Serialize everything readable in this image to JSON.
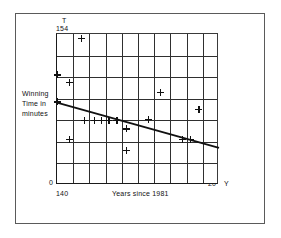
{
  "figure": {
    "frame": true,
    "background_color": "#ffffff",
    "ink_color": "#111111"
  },
  "axes": {
    "y_axis_symbol": "T",
    "y_axis_top_value": "154",
    "y_axis_origin_value": "0",
    "y_axis_title": "Winning Time in minutes",
    "x_axis_symbol": "Y",
    "x_axis_left_value": "140",
    "x_axis_right_value": "20",
    "x_axis_title": "Years since 1981"
  },
  "annotation": {
    "regression_equation": "T = 147.642-0.210Y"
  },
  "chart_data": {
    "type": "scatter",
    "title": "",
    "xlabel": "Years since 1981",
    "ylabel": "Winning Time in minutes",
    "xlim": [
      0,
      20
    ],
    "ylim": [
      140,
      154
    ],
    "grid": true,
    "grid_columns": 10,
    "grid_rows": 7,
    "x_ticks": [
      0,
      2,
      4,
      6,
      8,
      10,
      12,
      14,
      16,
      18,
      20
    ],
    "y_ticks": [
      140,
      142,
      144,
      146,
      148,
      150,
      152,
      154
    ],
    "legend": "none",
    "annotations": [
      {
        "text": "T = 147.642-0.210Y",
        "x": 7.2,
        "y": 149.4
      }
    ],
    "series": [
      {
        "name": "Winning time observations",
        "marker": "plus",
        "points": [
          {
            "x": 0.0,
            "y": 150.2
          },
          {
            "x": 1.5,
            "y": 149.5
          },
          {
            "x": 0.0,
            "y": 147.7
          },
          {
            "x": 3.4,
            "y": 146.0
          },
          {
            "x": 4.6,
            "y": 146.0
          },
          {
            "x": 5.5,
            "y": 146.0
          },
          {
            "x": 6.4,
            "y": 146.0
          },
          {
            "x": 7.4,
            "y": 146.0
          },
          {
            "x": 8.6,
            "y": 145.2
          },
          {
            "x": 11.3,
            "y": 146.1
          },
          {
            "x": 12.8,
            "y": 148.6
          },
          {
            "x": 1.5,
            "y": 144.2
          },
          {
            "x": 8.6,
            "y": 143.2
          },
          {
            "x": 15.5,
            "y": 144.2
          },
          {
            "x": 16.5,
            "y": 144.2
          },
          {
            "x": 17.5,
            "y": 147.0
          },
          {
            "x": 3.0,
            "y": 153.6
          }
        ]
      }
    ],
    "fit_line": {
      "name": "Least squares regression line",
      "equation": "T = 147.642 - 0.210Y",
      "intercept": 147.642,
      "slope": -0.21,
      "x_start": 0,
      "y_start": 147.642,
      "x_end": 20,
      "y_end": 143.442
    }
  }
}
